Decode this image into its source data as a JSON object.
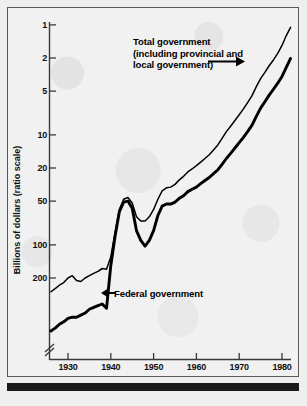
{
  "figure": {
    "background_color": "#efefef",
    "frame_color": "#5a5a5a",
    "line_color": "#000000"
  },
  "axes": {
    "y_title": "Billions of dollars (ratio scale)",
    "y_ticks": [
      "200",
      "100",
      "50",
      "20",
      "10",
      "5",
      "2",
      "1"
    ],
    "x_ticks": [
      "1930",
      "1940",
      "1950",
      "1960",
      "1970",
      "1980"
    ],
    "axis_break_marker": "//"
  },
  "annotations": {
    "total": {
      "line1": "Total government",
      "line2": "(including provincial and",
      "line3": "local government)"
    },
    "federal": {
      "label": "Federal government"
    }
  },
  "chart_data": {
    "type": "line",
    "title": "",
    "subtitle": "",
    "xlabel": "",
    "ylabel": "Billions of dollars (ratio scale)",
    "y_scale": "log",
    "ylim": [
      0.25,
      260
    ],
    "xlim": [
      1925,
      1982
    ],
    "y_tick_values": [
      1,
      2,
      5,
      10,
      20,
      50,
      100,
      200
    ],
    "x_tick_values": [
      1930,
      1940,
      1950,
      1960,
      1970,
      1980
    ],
    "grid": false,
    "legend": "annotations-on-plot",
    "axis_break": {
      "axis": "y",
      "location": "below-1",
      "style": "double-slash"
    },
    "series": [
      {
        "name": "Total government (including provincial and local government)",
        "style": "thin-line",
        "x": [
          1926,
          1927,
          1928,
          1929,
          1930,
          1931,
          1932,
          1933,
          1934,
          1935,
          1936,
          1937,
          1938,
          1939,
          1940,
          1941,
          1942,
          1943,
          1944,
          1945,
          1946,
          1947,
          1948,
          1949,
          1950,
          1951,
          1952,
          1953,
          1954,
          1955,
          1956,
          1957,
          1958,
          1959,
          1960,
          1961,
          1962,
          1963,
          1964,
          1965,
          1966,
          1967,
          1968,
          1969,
          1970,
          1971,
          1972,
          1973,
          1974,
          1975,
          1976,
          1977,
          1978,
          1979,
          1980,
          1981,
          1982
        ],
        "values": [
          0.75,
          0.8,
          0.86,
          0.91,
          1.0,
          1.05,
          0.95,
          0.93,
          1.0,
          1.05,
          1.1,
          1.15,
          1.22,
          1.2,
          1.55,
          2.6,
          4.2,
          5.2,
          5.4,
          4.8,
          3.6,
          3.3,
          3.3,
          3.6,
          4.2,
          5.2,
          6.2,
          6.6,
          6.7,
          7.1,
          7.8,
          8.4,
          9.2,
          9.8,
          10.5,
          11.3,
          12.2,
          13.2,
          14.6,
          16.2,
          18.6,
          21.4,
          24.0,
          27.0,
          30.5,
          34.5,
          39.5,
          45.5,
          55.0,
          65.0,
          74.0,
          85.0,
          96.0,
          110.0,
          130.0,
          160.0,
          190.0
        ]
      },
      {
        "name": "Federal government",
        "style": "thick-line",
        "x": [
          1926,
          1927,
          1928,
          1929,
          1930,
          1931,
          1932,
          1933,
          1934,
          1935,
          1936,
          1937,
          1938,
          1939,
          1940,
          1941,
          1942,
          1943,
          1944,
          1945,
          1946,
          1947,
          1948,
          1949,
          1950,
          1951,
          1952,
          1953,
          1954,
          1955,
          1956,
          1957,
          1958,
          1959,
          1960,
          1961,
          1962,
          1963,
          1964,
          1965,
          1966,
          1967,
          1968,
          1969,
          1970,
          1971,
          1972,
          1973,
          1974,
          1975,
          1976,
          1977,
          1978,
          1979,
          1980,
          1981,
          1982
        ],
        "values": [
          0.33,
          0.35,
          0.38,
          0.4,
          0.43,
          0.44,
          0.44,
          0.46,
          0.48,
          0.52,
          0.54,
          0.56,
          0.58,
          0.53,
          1.3,
          2.4,
          4.0,
          4.9,
          5.0,
          4.3,
          2.7,
          2.2,
          1.95,
          2.2,
          2.7,
          3.7,
          4.5,
          4.7,
          4.7,
          4.9,
          5.3,
          5.6,
          6.1,
          6.4,
          6.7,
          7.2,
          7.7,
          8.2,
          8.9,
          9.6,
          10.8,
          12.2,
          13.6,
          15.2,
          17.0,
          19.0,
          21.5,
          24.5,
          29.5,
          35.0,
          40.0,
          46.0,
          52.0,
          59.0,
          68.0,
          82.0,
          99.0
        ]
      }
    ]
  }
}
